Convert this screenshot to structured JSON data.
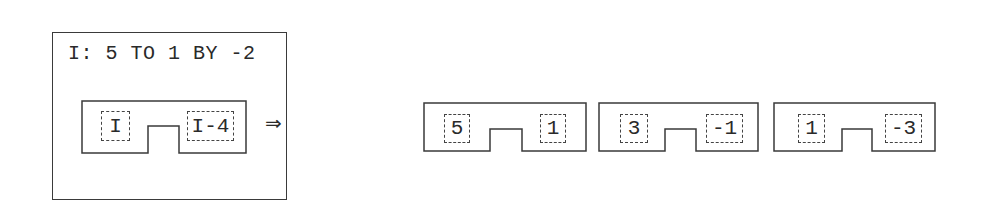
{
  "loop_box": {
    "header": "I: 5 TO 1 BY -2",
    "template": {
      "left": "I",
      "right": "I-4"
    },
    "arrow": "⇒"
  },
  "instances": [
    {
      "left": "5",
      "right": "1"
    },
    {
      "left": "3",
      "right": "-1"
    },
    {
      "left": "1",
      "right": "-3"
    }
  ],
  "colors": {
    "stroke": "#3a3a3a",
    "background": "#ffffff"
  }
}
